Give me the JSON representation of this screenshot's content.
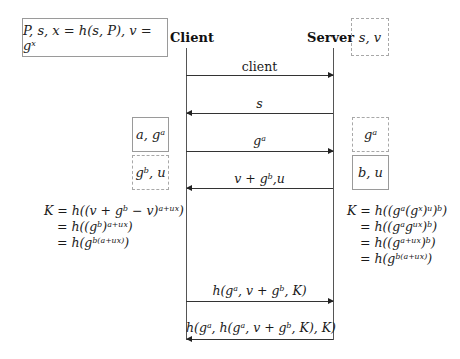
{
  "actors": {
    "client": "Client",
    "server": "Server"
  },
  "boxes": {
    "client_init": "P, s, x = h(s, P), v = gˣ",
    "server_init": "s, v",
    "client_a": "a, gᵃ",
    "client_recv": "gᵇ, u",
    "server_recv": "gᵃ",
    "server_b": "b, u"
  },
  "messages": [
    {
      "label": "client",
      "direction": "client-to-server"
    },
    {
      "label": "s",
      "direction": "server-to-client"
    },
    {
      "label": "gᵃ",
      "direction": "client-to-server"
    },
    {
      "label": "v + gᵇ,u",
      "direction": "server-to-client"
    },
    {
      "label": "h(gᵃ, v + gᵇ, K)",
      "direction": "client-to-server"
    },
    {
      "label": "h(gᵃ, h(gᵃ, v + gᵇ, K), K)",
      "direction": "server-to-client"
    }
  ],
  "client_key": [
    "K = h((v + gᵇ − v)ᵃ⁺ᵘˣ)",
    "= h((gᵇ)ᵃ⁺ᵘˣ)",
    "= h(gᵇ⁽ᵃ⁺ᵘˣ⁾)"
  ],
  "server_key": [
    "K = h((gᵃ(gˣ)ᵘ)ᵇ)",
    "= h((gᵃgᵘˣ)ᵇ)",
    "= h((gᵃ⁺ᵘˣ)ᵇ)",
    "= h(gᵇ⁽ᵃ⁺ᵘˣ⁾)"
  ]
}
